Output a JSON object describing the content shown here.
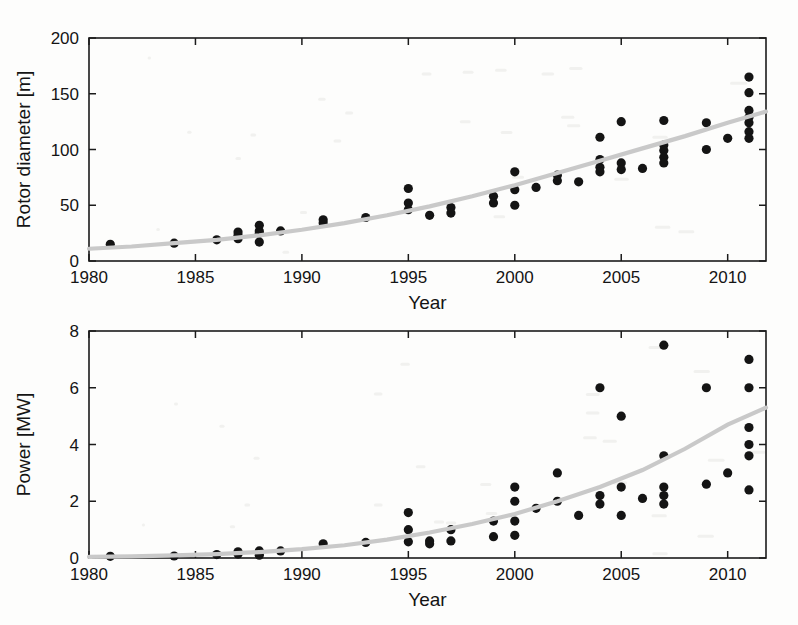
{
  "figure": {
    "background_color": "#fdfdfc",
    "point_color": "#141414",
    "fit_curve_color": "#c9c9c9",
    "axis_color": "#1b1b1b"
  },
  "chart_data": [
    {
      "id": "rotor-diameter",
      "type": "scatter",
      "title": "",
      "xlabel": "Year",
      "ylabel": "Rotor diameter [m]",
      "xlim": [
        1980,
        2011.8
      ],
      "ylim": [
        0,
        200
      ],
      "xticks": [
        1980,
        1985,
        1990,
        1995,
        2000,
        2005,
        2010
      ],
      "xticklabels": [
        "1980",
        "1985",
        "1990",
        "1995",
        "2000",
        "2005",
        "2010"
      ],
      "yticks": [
        0,
        50,
        100,
        150,
        200
      ],
      "yticklabels": [
        "0",
        "50",
        "100",
        "150",
        "200"
      ],
      "grid": false,
      "legend": "none",
      "series": [
        {
          "name": "Rotor diameter of commercial wind turbines",
          "marker": "filled-circle",
          "x": [
            1981,
            1984,
            1986,
            1987,
            1987,
            1987,
            1988,
            1988,
            1988,
            1988,
            1989,
            1991,
            1991,
            1993,
            1995,
            1995,
            1995,
            1996,
            1997,
            1997,
            1999,
            1999,
            2000,
            2000,
            2000,
            2001,
            2002,
            2002,
            2003,
            2004,
            2004,
            2004,
            2004,
            2005,
            2005,
            2005,
            2006,
            2007,
            2007,
            2007,
            2007,
            2007,
            2009,
            2009,
            2010,
            2011,
            2011,
            2011,
            2011,
            2011,
            2011,
            2011
          ],
          "y": [
            15,
            16,
            19,
            26,
            23,
            20,
            32,
            27,
            25,
            17,
            27,
            37,
            34,
            39,
            65,
            52,
            46,
            41,
            48,
            43,
            58,
            52,
            80,
            64,
            50,
            66,
            77,
            72,
            71,
            111,
            91,
            84,
            80,
            125,
            88,
            82,
            83,
            126,
            104,
            99,
            93,
            88,
            124,
            100,
            110,
            165,
            151,
            135,
            129,
            124,
            116,
            110
          ]
        },
        {
          "name": "Exponential trend fit",
          "marker": "line",
          "x": [
            1980,
            1982,
            1984,
            1986,
            1988,
            1990,
            1992,
            1994,
            1996,
            1998,
            2000,
            2002,
            2004,
            2006,
            2008,
            2010,
            2011.8
          ],
          "y": [
            11,
            13,
            16,
            19,
            23,
            28,
            34,
            41,
            49,
            58,
            68,
            79,
            90,
            101,
            112,
            124,
            134
          ]
        }
      ]
    },
    {
      "id": "power",
      "type": "scatter",
      "title": "",
      "xlabel": "Year",
      "ylabel": "Power [MW]",
      "xlim": [
        1980,
        2011.8
      ],
      "ylim": [
        0,
        8
      ],
      "xticks": [
        1980,
        1985,
        1990,
        1995,
        2000,
        2005,
        2010
      ],
      "xticklabels": [
        "1980",
        "1985",
        "1990",
        "1995",
        "2000",
        "2005",
        "2010"
      ],
      "yticks": [
        0,
        2,
        4,
        6,
        8
      ],
      "yticklabels": [
        "0",
        "2",
        "4",
        "6",
        "8"
      ],
      "grid": false,
      "legend": "none",
      "series": [
        {
          "name": "Rated power of commercial wind turbines",
          "marker": "filled-circle",
          "x": [
            1981,
            1984,
            1986,
            1987,
            1987,
            1988,
            1988,
            1988,
            1989,
            1991,
            1993,
            1995,
            1995,
            1995,
            1996,
            1996,
            1997,
            1997,
            1999,
            1999,
            2000,
            2000,
            2000,
            2000,
            2001,
            2002,
            2002,
            2003,
            2004,
            2004,
            2004,
            2005,
            2005,
            2005,
            2006,
            2007,
            2007,
            2007,
            2007,
            2007,
            2009,
            2009,
            2010,
            2011,
            2011,
            2011,
            2011,
            2011,
            2011
          ],
          "y": [
            0.06,
            0.07,
            0.12,
            0.22,
            0.14,
            0.25,
            0.18,
            0.1,
            0.25,
            0.5,
            0.55,
            1.6,
            1.0,
            0.57,
            0.6,
            0.5,
            1.0,
            0.6,
            1.3,
            0.75,
            2.5,
            2.0,
            1.3,
            0.8,
            1.75,
            3.0,
            2.0,
            1.5,
            6.0,
            2.2,
            1.9,
            5.0,
            2.5,
            1.5,
            2.1,
            7.5,
            3.6,
            2.5,
            2.2,
            1.9,
            6.0,
            2.6,
            3.0,
            7.0,
            6.0,
            4.6,
            4.0,
            3.6,
            2.4
          ]
        },
        {
          "name": "Exponential trend fit",
          "marker": "line",
          "x": [
            1980,
            1982,
            1984,
            1986,
            1988,
            1990,
            1992,
            1994,
            1996,
            1998,
            2000,
            2002,
            2004,
            2006,
            2008,
            2010,
            2011.8
          ],
          "y": [
            0.04,
            0.06,
            0.09,
            0.14,
            0.21,
            0.31,
            0.45,
            0.65,
            0.9,
            1.2,
            1.55,
            2.0,
            2.5,
            3.1,
            3.85,
            4.7,
            5.3
          ]
        }
      ]
    }
  ]
}
